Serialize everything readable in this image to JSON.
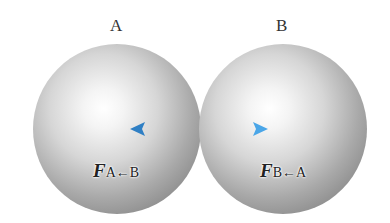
{
  "labels": {
    "a": "A",
    "b": "B"
  },
  "forces": {
    "on_a": {
      "symbol": "F",
      "subscript": "A←B"
    },
    "on_b": {
      "symbol": "F",
      "subscript": "B←A"
    }
  },
  "colors": {
    "arrow": "#3a8fd6",
    "sphere_highlight": "#ffffff",
    "sphere_shadow": "#7a7a7a"
  }
}
